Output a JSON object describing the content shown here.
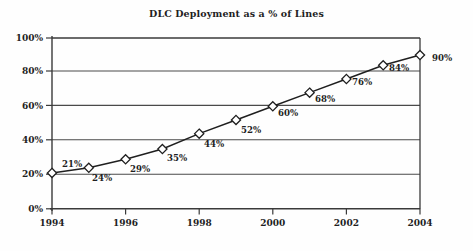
{
  "chart_data": {
    "type": "line",
    "title": "DLC Deployment as a % of Lines",
    "xlabel": "",
    "ylabel": "",
    "x": [
      1994,
      1995,
      1996,
      1997,
      1998,
      1999,
      2000,
      2001,
      2002,
      2003,
      2004
    ],
    "values": [
      21,
      24,
      29,
      35,
      44,
      52,
      60,
      68,
      76,
      84,
      90
    ],
    "point_labels": [
      "21%",
      "24%",
      "29%",
      "35%",
      "44%",
      "52%",
      "60%",
      "68%",
      "76%",
      "84%",
      "90%"
    ],
    "categories": [
      "1994",
      "1995",
      "1996",
      "1997",
      "1998",
      "1999",
      "2000",
      "2001",
      "2002",
      "2003",
      "2004"
    ],
    "xtick_labels": [
      "1994",
      "1996",
      "1998",
      "2000",
      "2002",
      "2004"
    ],
    "xtick_values": [
      1994,
      1996,
      1998,
      2000,
      2002,
      2004
    ],
    "ytick_labels": [
      "0%",
      "20%",
      "40%",
      "60%",
      "80%",
      "100%"
    ],
    "ytick_values": [
      0,
      20,
      40,
      60,
      80,
      100
    ],
    "xlim": [
      1994,
      2004
    ],
    "ylim": [
      0,
      100
    ],
    "grid": "horizontal",
    "legend": "none",
    "marker": "diamond",
    "line_color": "#1f1f1f",
    "marker_fill": "#ffffff",
    "marker_edge": "#1f1f1f",
    "grid_color": "#4a4a4a",
    "axis_color": "#3a3a3a",
    "background": "#fefefe"
  },
  "labels": {
    "y0": "0%",
    "y20": "20%",
    "y40": "40%",
    "y60": "60%",
    "y80": "80%",
    "y100": "100%",
    "x1994": "1994",
    "x1996": "1996",
    "x1998": "1998",
    "x2000": "2000",
    "x2002": "2002",
    "x2004": "2004",
    "p0": "21%",
    "p1": "24%",
    "p2": "29%",
    "p3": "35%",
    "p4": "44%",
    "p5": "52%",
    "p6": "60%",
    "p7": "68%",
    "p8": "76%",
    "p9": "84%",
    "p10": "90%"
  }
}
